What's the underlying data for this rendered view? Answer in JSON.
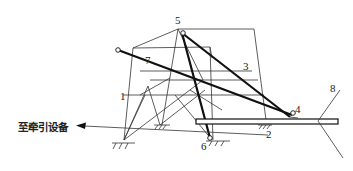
{
  "diagram": {
    "type": "linkage-mechanism",
    "annotation": "至牵引设备",
    "labels": [
      {
        "id": "1",
        "text": "1"
      },
      {
        "id": "2",
        "text": "2"
      },
      {
        "id": "3",
        "text": "3"
      },
      {
        "id": "4",
        "text": "4"
      },
      {
        "id": "5",
        "text": "5"
      },
      {
        "id": "6",
        "text": "6"
      },
      {
        "id": "7",
        "text": "7"
      },
      {
        "id": "8",
        "text": "8"
      }
    ]
  }
}
